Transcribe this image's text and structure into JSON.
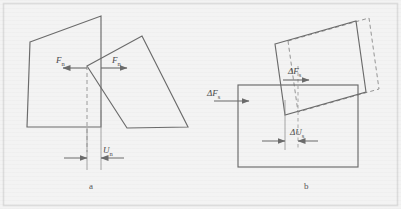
{
  "figure": {
    "name": "contact-mechanics-normal-and-shear-diagram",
    "background_color": "#f3f3f3",
    "frame_color": "#d8d8d8",
    "line_color": "#6b6b6b",
    "text_color": "#4a4a4a",
    "width": 401,
    "height": 209
  },
  "panel_a": {
    "caption": "a",
    "force_label_left": "F",
    "force_label_left_sub": "n",
    "force_label_right": "F",
    "force_label_right_sub": "n",
    "displacement_label": "U",
    "displacement_label_sub": "n",
    "description": "Two polygonal blocks in normal contact with opposing normal forces and normal overlap dimension"
  },
  "panel_b": {
    "caption": "b",
    "shear_force_label_left": "ΔF",
    "shear_force_label_left_sub": "s",
    "shear_force_label_inner": "ΔF",
    "shear_force_label_inner_sub": "s",
    "shear_displacement_label": "ΔU",
    "shear_displacement_label_sub": "s",
    "description": "Parallelogram block sheared over a rectangular block, dashed outline shows displaced position"
  }
}
